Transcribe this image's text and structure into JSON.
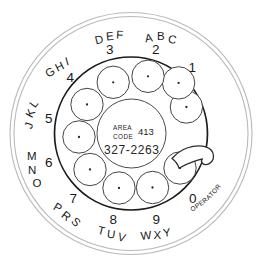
{
  "device": {
    "name": "rotary-telephone-dial",
    "title": "Rotary Telephone Dial"
  },
  "colors": {
    "faceplate_stroke": "#b9b9b9",
    "dial_stroke": "#1b1b1b",
    "hole_stroke": "#3a3a3a",
    "ink": "#1a1a1a",
    "background": "#ffffff"
  },
  "center_card": {
    "area_label_line1": "AREA",
    "area_label_line2": "CODE",
    "area_code": "413",
    "phone_number": "327-2263"
  },
  "finger_stop": {
    "label": "finger-stop"
  },
  "dial_positions": [
    {
      "digit": "1",
      "letters": "",
      "letter_chars": [],
      "angle_deg": -63
    },
    {
      "digit": "2",
      "letters": "ABC",
      "letter_chars": [
        "A",
        "B",
        "C"
      ],
      "angle_deg": -27
    },
    {
      "digit": "3",
      "letters": "DEF",
      "letter_chars": [
        "D",
        "E",
        "F"
      ],
      "angle_deg": 9
    },
    {
      "digit": "4",
      "letters": "GHI",
      "letter_chars": [
        "G",
        "H",
        "I"
      ],
      "angle_deg": 45
    },
    {
      "digit": "5",
      "letters": "JKL",
      "letter_chars": [
        "J",
        "K",
        "L"
      ],
      "angle_deg": 81
    },
    {
      "digit": "6",
      "letters": "MNO",
      "letter_chars": [
        "M",
        "N",
        "O"
      ],
      "angle_deg": 117
    },
    {
      "digit": "7",
      "letters": "PRS",
      "letter_chars": [
        "P",
        "R",
        "S"
      ],
      "angle_deg": 153
    },
    {
      "digit": "8",
      "letters": "TUV",
      "letter_chars": [
        "T",
        "U",
        "V"
      ],
      "angle_deg": 189
    },
    {
      "digit": "9",
      "letters": "WXY",
      "letter_chars": [
        "W",
        "X",
        "Y"
      ],
      "angle_deg": 225
    },
    {
      "digit": "0",
      "letters": "OPERATOR",
      "letter_chars": [
        "O",
        "P",
        "E",
        "R",
        "A",
        "T",
        "O",
        "R"
      ],
      "angle_deg": 261
    }
  ],
  "digits": {
    "d1": "1",
    "d2": "2",
    "d3": "3",
    "d4": "4",
    "d5": "5",
    "d6": "6",
    "d7": "7",
    "d8": "8",
    "d9": "9",
    "d0": "0"
  },
  "letter_groups": {
    "g2_a": "A",
    "g2_b": "B",
    "g2_c": "C",
    "g3_d": "D",
    "g3_e": "E",
    "g3_f": "F",
    "g4_g": "G",
    "g4_h": "H",
    "g4_i": "I",
    "g5_j": "J",
    "g5_k": "K",
    "g5_l": "L",
    "g6_m": "M",
    "g6_n": "N",
    "g6_o": "O",
    "g7_p": "P",
    "g7_r": "R",
    "g7_s": "S",
    "g8_t": "T",
    "g8_u": "U",
    "g8_v": "V",
    "g9_w": "W",
    "g9_x": "X",
    "g9_y": "Y",
    "operator": "OPERATOR"
  }
}
